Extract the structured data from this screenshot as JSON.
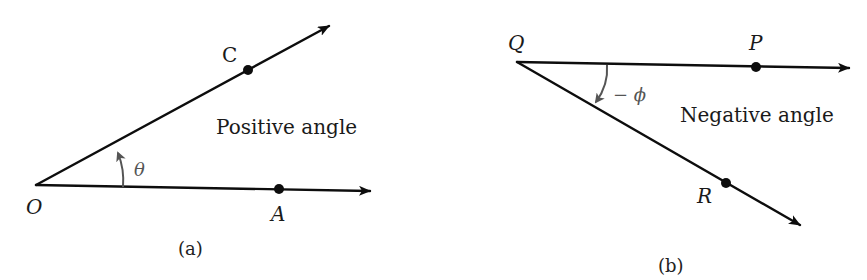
{
  "figure": {
    "panel_a": {
      "caption": "(a)",
      "description": "Positive angle",
      "angle_symbol": "θ",
      "vertex": {
        "label": "O",
        "x": 36,
        "y": 185
      },
      "rays": [
        {
          "name": "OA",
          "point_label": "A",
          "point": {
            "x": 279,
            "y": 189
          },
          "tip": {
            "x": 372,
            "y": 191
          }
        },
        {
          "name": "OC",
          "point_label": "C",
          "point": {
            "x": 248,
            "y": 70
          },
          "tip": {
            "x": 331,
            "y": 25
          }
        }
      ]
    },
    "panel_b": {
      "caption": "(b)",
      "description": "Negative angle",
      "angle_symbol": "− ϕ",
      "vertex": {
        "label": "Q",
        "x": 517,
        "y": 62
      },
      "rays": [
        {
          "name": "QP",
          "point_label": "P",
          "point": {
            "x": 756,
            "y": 67
          },
          "tip": {
            "x": 851,
            "y": 68
          }
        },
        {
          "name": "QR",
          "point_label": "R",
          "point": {
            "x": 726,
            "y": 183
          },
          "tip": {
            "x": 802,
            "y": 226
          }
        }
      ]
    },
    "colors": {
      "ray": "#0d0d0d",
      "angle_arc": "#555555",
      "text": "#1a1a1a",
      "background": "#ffffff"
    }
  }
}
